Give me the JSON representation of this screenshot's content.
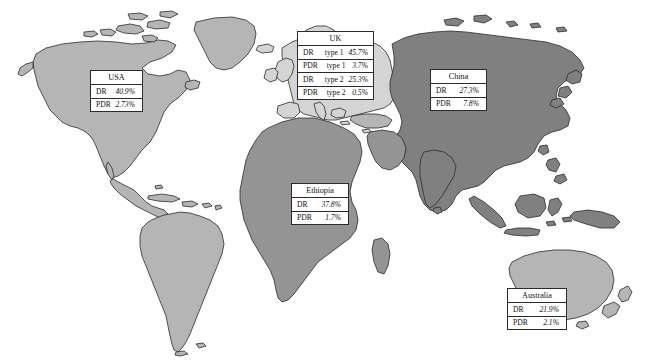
{
  "figure": {
    "type": "choropleth-world-map-with-callouts",
    "background_color": "#ffffff",
    "outline_color": "#2b2b2b"
  },
  "map_regions": [
    {
      "name": "north-america",
      "label": "North America",
      "fill": "#b5b5b5"
    },
    {
      "name": "south-america",
      "label": "South America",
      "fill": "#b5b5b5"
    },
    {
      "name": "greenland",
      "label": "Greenland",
      "fill": "#b5b5b5"
    },
    {
      "name": "europe",
      "label": "Europe",
      "fill": "#d4d4d4"
    },
    {
      "name": "africa",
      "label": "Africa",
      "fill": "#949494"
    },
    {
      "name": "asia",
      "label": "Asia",
      "fill": "#808080"
    },
    {
      "name": "australia",
      "label": "Australia",
      "fill": "#b5b5b5"
    },
    {
      "name": "new-zealand",
      "label": "New Zealand",
      "fill": "#b5b5b5"
    }
  ],
  "callouts": [
    {
      "id": "usa",
      "title": "USA",
      "rows": [
        {
          "label": "DR",
          "type": "",
          "value": "40.9%"
        },
        {
          "label": "PDR",
          "type": "",
          "value": "2.73%"
        }
      ]
    },
    {
      "id": "uk",
      "title": "UK",
      "rows": [
        {
          "label": "DR",
          "type": "type 1",
          "value": "45.7%"
        },
        {
          "label": "PDR",
          "type": "type 1",
          "value": "3.7%"
        },
        {
          "label": "DR",
          "type": "type 2",
          "value": "25.3%"
        },
        {
          "label": "PDR",
          "type": "type 2",
          "value": "0.5%"
        }
      ]
    },
    {
      "id": "china",
      "title": "China",
      "rows": [
        {
          "label": "DR",
          "type": "",
          "value": "27.3%"
        },
        {
          "label": "PDR",
          "type": "",
          "value": "7.8%"
        }
      ]
    },
    {
      "id": "ethiopia",
      "title": "Ethiopia",
      "rows": [
        {
          "label": "DR",
          "type": "",
          "value": "37.8%"
        },
        {
          "label": "PDR",
          "type": "",
          "value": "1.7%"
        }
      ]
    },
    {
      "id": "australia",
      "title": "Australia",
      "rows": [
        {
          "label": "DR",
          "type": "",
          "value": "21.9%"
        },
        {
          "label": "PDR",
          "type": "",
          "value": "2.1%"
        }
      ]
    }
  ]
}
